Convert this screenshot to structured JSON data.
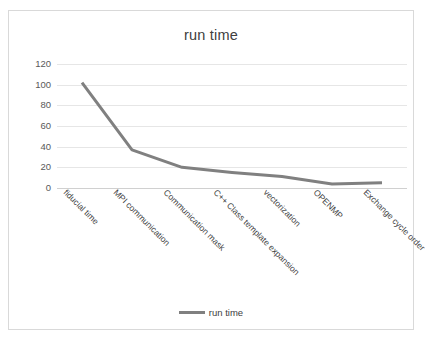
{
  "chart_data": {
    "type": "line",
    "title": "run time",
    "xlabel": "",
    "ylabel": "",
    "ylim": [
      0,
      120
    ],
    "yticks": [
      0,
      20,
      40,
      60,
      80,
      100,
      120
    ],
    "ytick_labels": [
      "0",
      "20",
      "40",
      "60",
      "80",
      "100",
      "120"
    ],
    "grid": true,
    "legend_position": "bottom",
    "legend_entries": [
      "run time"
    ],
    "series_color": "#808080",
    "categories": [
      "fiducial time",
      "MPI communication",
      "Communication mask",
      "C++ Class template expansion",
      "vectorization",
      "OPENMP",
      "Exchange cycle order"
    ],
    "series": [
      {
        "name": "run time",
        "values": [
          102,
          37,
          20,
          15,
          11,
          4,
          5
        ]
      }
    ]
  },
  "legend": {
    "label": "run time"
  },
  "frame": {
    "border_color": "#d9d9d9",
    "background": "#ffffff"
  }
}
